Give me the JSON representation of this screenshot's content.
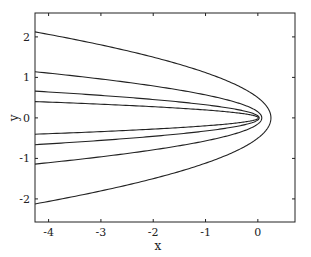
{
  "chart_data": {
    "type": "line",
    "title": "",
    "xlabel": "x",
    "ylabel": "y",
    "xlim": [
      -4.26,
      0.71
    ],
    "ylim": [
      -2.57,
      2.59
    ],
    "xticks": [
      -4,
      -3,
      -2,
      -1,
      0
    ],
    "xtick_labels": [
      "-4",
      "-3",
      "-2",
      "-1",
      "0"
    ],
    "yticks": [
      -2,
      -1,
      0,
      1,
      2
    ],
    "ytick_labels": [
      "-2",
      "-1",
      "0",
      "1",
      "2"
    ],
    "grid": false,
    "legend": null,
    "line_color": "#222222",
    "series": [
      {
        "name": "parabola p=0.5",
        "p": 0.5,
        "vertex_x": 0.25,
        "y_at_left_edge": 2.17
      },
      {
        "name": "parabola p=0.15",
        "p": 0.15,
        "vertex_x": 0.075,
        "y_at_left_edge": 1.14
      },
      {
        "name": "parabola p=0.051",
        "p": 0.051,
        "vertex_x": 0.026,
        "y_at_left_edge": 0.66
      },
      {
        "name": "parabola p=0.019",
        "p": 0.019,
        "vertex_x": 0.01,
        "y_at_left_edge": 0.4
      }
    ]
  },
  "layout": {
    "plot_left": 35,
    "plot_top": 13,
    "plot_right": 295,
    "plot_bottom": 222
  }
}
